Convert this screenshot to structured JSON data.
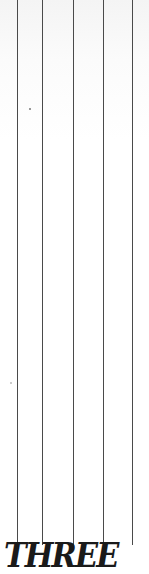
{
  "poster": {
    "title": "THREE",
    "line_color": "#4a4a4a",
    "text_color": "#1a1a1a",
    "line_count": 5
  }
}
